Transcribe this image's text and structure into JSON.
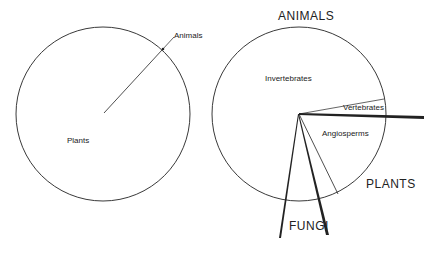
{
  "left_diagram": {
    "labels": {
      "animals": "Animals",
      "plants": "Plants"
    }
  },
  "right_diagram": {
    "labels": {
      "animals": "ANIMALS",
      "invertebrates": "Invertebrates",
      "vertebrates": "Vertebrates",
      "angiosperms": "Angiosperms",
      "plants": "PLANTS",
      "fungi": "FUNGI"
    }
  },
  "colors": {
    "line": "#222222",
    "background": "#ffffff"
  }
}
